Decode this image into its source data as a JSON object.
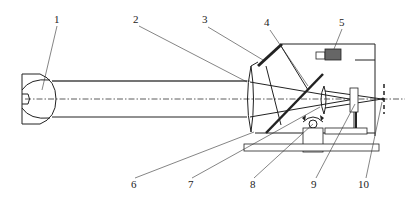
{
  "diagram": {
    "type": "optical-system-schematic",
    "labels": [
      {
        "id": "1",
        "text": "1",
        "x": 57,
        "y": 23
      },
      {
        "id": "2",
        "text": "2",
        "x": 136,
        "y": 23
      },
      {
        "id": "3",
        "text": "3",
        "x": 205,
        "y": 23
      },
      {
        "id": "4",
        "text": "4",
        "x": 267,
        "y": 26
      },
      {
        "id": "5",
        "text": "5",
        "x": 342,
        "y": 26
      },
      {
        "id": "6",
        "text": "6",
        "x": 135,
        "y": 187
      },
      {
        "id": "7",
        "text": "7",
        "x": 191,
        "y": 187
      },
      {
        "id": "8",
        "text": "8",
        "x": 253,
        "y": 187
      },
      {
        "id": "9",
        "text": "9",
        "x": 314,
        "y": 187
      },
      {
        "id": "10",
        "text": "10",
        "x": 361,
        "y": 187
      }
    ],
    "colors": {
      "line": "#222222",
      "detector_fill": "#666666",
      "background": "#ffffff"
    }
  }
}
